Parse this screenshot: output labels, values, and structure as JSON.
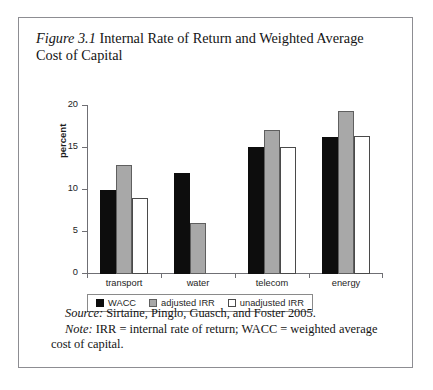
{
  "figure": {
    "label": "Figure 3.1",
    "title": "Internal Rate of Return and Weighted Average Cost of Capital",
    "source_lead": "Source:",
    "source_text": " Sirtaine, Pinglo, Guasch, and Foster 2005.",
    "note_lead": "Note:",
    "note_text": " IRR = internal rate of return; WACC = weighted average cost of capital."
  },
  "chart_data": {
    "type": "bar",
    "title": "Internal Rate of Return and Weighted Average Cost of Capital",
    "xlabel": "",
    "ylabel": "percent",
    "ylim": [
      0,
      20
    ],
    "yticks": [
      0,
      5,
      10,
      15,
      20
    ],
    "ytick_labels": [
      "0",
      "5",
      "10",
      "15",
      "20"
    ],
    "grid": false,
    "legend_position": "bottom",
    "categories": [
      "transport",
      "water",
      "telecom",
      "energy"
    ],
    "series": [
      {
        "name": "WACC",
        "color": "#0d0d0d",
        "values": [
          10.0,
          12.0,
          15.1,
          16.3
        ]
      },
      {
        "name": "adjusted IRR",
        "color": "#a8a8a8",
        "values": [
          13.0,
          6.1,
          17.2,
          19.4
        ]
      },
      {
        "name": "unadjusted IRR",
        "color": "#ffffff",
        "values": [
          9.0,
          0.0,
          15.1,
          16.4
        ]
      }
    ]
  }
}
